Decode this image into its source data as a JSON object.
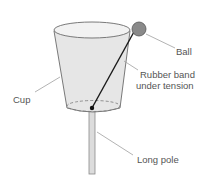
{
  "diagram": {
    "labels": {
      "ball": "Ball",
      "rubber_band_line1": "Rubber band",
      "rubber_band_line2": "under tension",
      "cup": "Cup",
      "pole": "Long pole"
    },
    "colors": {
      "cup_fill": "#e4e4e4",
      "cup_stroke": "#6b6b6b",
      "ball_fill": "#8a8a8a",
      "band": "#1a1a1a",
      "leader": "#9a9a9a",
      "pole_fill": "#dcdcdc"
    }
  }
}
